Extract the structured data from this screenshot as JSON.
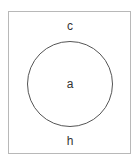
{
  "diagram": {
    "type": "venn",
    "universe": {
      "label_top": "c",
      "label_bottom": "h",
      "border_color": "#b8b8b8"
    },
    "sets": [
      {
        "label": "a",
        "stroke_color": "#555555"
      }
    ]
  }
}
